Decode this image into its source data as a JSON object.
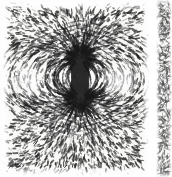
{
  "figure": {
    "kind": "scanned-photograph",
    "subject": "iron filings aligned in the magnetic field of a bar magnet",
    "caption": "",
    "panel_count": 2,
    "media": "halftone scan on off-white paper",
    "ink_color": "#1b1b1b",
    "paper_color": "#fbfbfa",
    "gutter_color": "#ffffff"
  },
  "main_panel": {
    "label": "iron-filings-dipole-field",
    "x": 3,
    "y": 2,
    "width": 146,
    "height": 174,
    "magnet": {
      "orientation": "vertical",
      "center_x": 80,
      "top_pole_y": 58,
      "bottom_pole_y": 98,
      "body_top_y": 64,
      "body_bottom_y": 94,
      "body_width": 13
    },
    "pole_clusters": [
      {
        "name": "upper-pole",
        "cx": 80,
        "cy": 58,
        "radius": 15,
        "density": "very-high"
      },
      {
        "name": "lower-pole",
        "cx": 80,
        "cy": 98,
        "radius": 15,
        "density": "very-high"
      }
    ],
    "neutral_zones": [
      {
        "name": "left-neutral-zone",
        "cx": 26,
        "cy": 78
      },
      {
        "name": "right-neutral-zone",
        "cx": 117,
        "cy": 78
      }
    ],
    "field_pattern": "dipole",
    "radiating_rays": 34,
    "field_arc_loops": 9,
    "background_filings": "dense random scatter thinning toward the margins"
  },
  "side_panel": {
    "label": "adjacent-figure-sliver",
    "x": 156,
    "y": 0,
    "width": 16,
    "height": 177,
    "content": "partial edge of a neighbouring iron-filings photograph",
    "density": "moderate random scatter"
  }
}
